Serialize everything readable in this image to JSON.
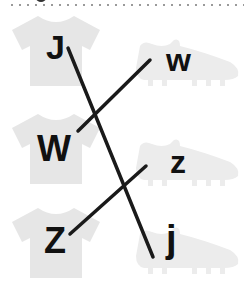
{
  "worksheet": {
    "instructions_hidden": true,
    "shirts": [
      {
        "letter": "J"
      },
      {
        "letter": "W"
      },
      {
        "letter": "Z"
      }
    ],
    "shoes": [
      {
        "letter": "w"
      },
      {
        "letter": "z"
      },
      {
        "letter": "j"
      }
    ],
    "matches": [
      {
        "from": "J",
        "to": "j"
      },
      {
        "from": "W",
        "to": "w"
      },
      {
        "from": "Z",
        "to": "z"
      }
    ],
    "colors": {
      "item_fill": "#e6e6e6",
      "line": "#1a1a1a",
      "letter": "#111111"
    }
  }
}
